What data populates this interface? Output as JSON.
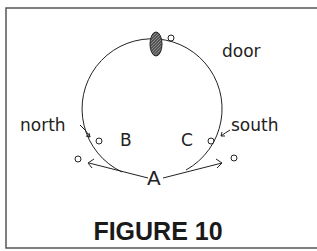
{
  "figure": {
    "caption": "FIGURE 10",
    "labels": {
      "door": "door",
      "north": "north",
      "south": "south",
      "a": "A",
      "b": "B",
      "c": "C"
    },
    "colors": {
      "ink": "#222222",
      "frame": "#555555"
    }
  }
}
